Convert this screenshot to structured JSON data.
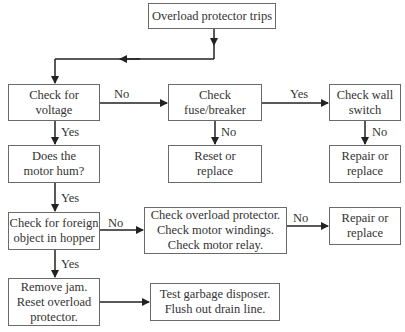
{
  "diagram": {
    "type": "flowchart",
    "nodes": {
      "start": "Overload protector trips",
      "check_voltage": "Check for\nvoltage",
      "check_fuse": "Check\nfuse/breaker",
      "check_wall_switch": "Check wall\nswitch",
      "motor_hum": "Does the\nmotor hum?",
      "reset_replace": "Reset or\nreplace",
      "repair_replace_1": "Repair or\nreplace",
      "foreign_object": "Check for foreign\nobject in hopper",
      "check_overload": "Check overload protector.\nCheck motor windings.\nCheck motor relay.",
      "repair_replace_2": "Repair or\nreplace",
      "remove_jam": "Remove jam.\nReset overload\nprotector.",
      "test_disposer": "Test garbage disposer.\nFlush out drain line."
    },
    "edge_labels": {
      "voltage_to_fuse": "No",
      "fuse_to_wall": "Yes",
      "voltage_to_hum": "Yes",
      "fuse_to_reset": "No",
      "wall_to_repair": "No",
      "hum_to_foreign": "Yes",
      "foreign_to_overload": "No",
      "overload_to_repair": "No",
      "foreign_to_jam": "Yes"
    },
    "colors": {
      "line": "#222222",
      "border": "#6a6a6a",
      "text": "#333333"
    }
  }
}
